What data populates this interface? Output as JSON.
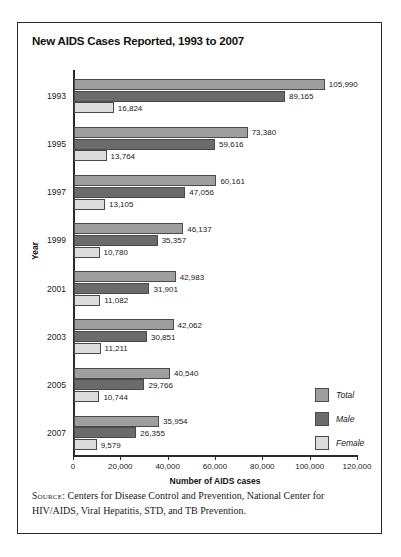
{
  "chart_data": {
    "type": "bar",
    "orientation": "horizontal",
    "title": "New AIDS Cases Reported, 1993 to 2007",
    "xlabel": "Number of AIDS cases",
    "ylabel": "Year",
    "xlim": [
      0,
      120000
    ],
    "xticks": [
      0,
      20000,
      40000,
      60000,
      80000,
      100000,
      120000
    ],
    "xtick_labels": [
      "0",
      "20,000",
      "40,000",
      "60,000",
      "80,000",
      "100,000",
      "120,000"
    ],
    "grid": false,
    "legend_position": "right-inside",
    "categories": [
      "1993",
      "1995",
      "1997",
      "1999",
      "2001",
      "2003",
      "2005",
      "2007"
    ],
    "series": [
      {
        "name": "Total",
        "color": "#9e9e9e",
        "values": [
          105990,
          73380,
          60161,
          46137,
          42983,
          42062,
          40540,
          35954
        ],
        "labels": [
          "105,990",
          "73,380",
          "60,161",
          "46,137",
          "42,983",
          "42,062",
          "40,540",
          "35,954"
        ]
      },
      {
        "name": "Male",
        "color": "#6b6b6b",
        "values": [
          89165,
          59616,
          47056,
          35357,
          31901,
          30851,
          29766,
          26355
        ],
        "labels": [
          "89,165",
          "59,616",
          "47,056",
          "35,357",
          "31,901",
          "30,851",
          "29,766",
          "26,355"
        ]
      },
      {
        "name": "Female",
        "color": "#dcdcdc",
        "values": [
          16824,
          13764,
          13105,
          10780,
          11082,
          11211,
          10744,
          9579
        ],
        "labels": [
          "16,824",
          "13,764",
          "13,105",
          "10,780",
          "11,082",
          "11,211",
          "10,744",
          "9,579"
        ]
      }
    ]
  },
  "source": {
    "label": "Source:",
    "text": " Centers for Disease Control and Prevention, National Center for HIV/AIDS, Viral Hepatitis, STD, and TB Prevention."
  }
}
